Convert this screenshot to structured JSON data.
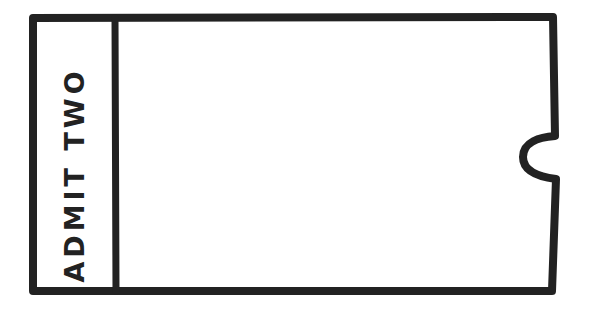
{
  "ticket": {
    "stub": {
      "label": "ADMIT TWO"
    },
    "body": {
      "content": ""
    },
    "colors": {
      "stroke": "#222222",
      "background": "#ffffff"
    },
    "shape": {
      "notch_side": "right",
      "style": "hand-drawn outline"
    }
  }
}
